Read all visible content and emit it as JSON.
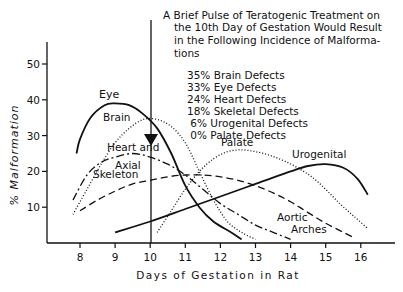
{
  "chart_data": {
    "type": "line",
    "title": "",
    "xlabel": "Days of Gestation in Rat",
    "ylabel": "% Malformation",
    "xlim": [
      7.1,
      17.2
    ],
    "ylim": [
      0,
      55
    ],
    "x_ticks": [
      8,
      9,
      10,
      11,
      12,
      13,
      14,
      15,
      16
    ],
    "y_ticks": [
      10,
      20,
      30,
      40,
      50
    ],
    "grid": false,
    "annotation": {
      "lines": [
        "A Brief Pulse of Teratogenic Treatment on",
        "the 10th Day of Gestation Would Result",
        "in the Following Incidence of Malforma-",
        "tions"
      ],
      "list": [
        "35% Brain Defects",
        "33% Eye Defects",
        "24% Heart Defects",
        "18% Skeletal Defects",
        " 6% Urogenital Defects",
        " 0% Palate Defects"
      ],
      "arrow_at_day": 10
    },
    "series": [
      {
        "name": "Eye",
        "style": "solid",
        "x": [
          7.9,
          8.0,
          8.3,
          8.7,
          9.0,
          9.4,
          9.8,
          10.2,
          10.6,
          11.0,
          11.4,
          11.8,
          12.3,
          12.6
        ],
        "y": [
          25,
          29,
          35,
          38.5,
          39,
          38.5,
          36,
          32,
          25,
          16,
          10,
          6,
          3,
          1
        ]
      },
      {
        "name": "Brain",
        "style": "dotted",
        "x": [
          7.8,
          8.2,
          8.6,
          9.0,
          9.4,
          9.8,
          10.2,
          10.6,
          11.0,
          11.4,
          11.8,
          12.2,
          12.6,
          13.0
        ],
        "y": [
          8,
          15,
          22,
          28,
          32,
          34.5,
          34.5,
          32.5,
          28,
          20,
          12,
          6,
          3,
          1
        ]
      },
      {
        "name": "Heart and Aortic Arches",
        "style": "dash-dot",
        "x": [
          7.8,
          8.2,
          8.6,
          9.0,
          9.5,
          10.0,
          10.5,
          11.0,
          11.5,
          12.0,
          12.5,
          13.0,
          13.5,
          14.0
        ],
        "y": [
          12,
          19,
          22.5,
          24,
          25,
          24,
          22,
          19,
          15,
          11,
          8,
          5,
          3,
          1
        ]
      },
      {
        "name": "Axial Skeleton",
        "style": "dashed",
        "x": [
          8.0,
          8.5,
          9.0,
          9.5,
          10.0,
          10.5,
          11.0,
          11.5,
          12.0,
          12.5,
          13.0,
          13.5,
          14.0,
          14.5,
          15.0,
          15.5,
          15.8
        ],
        "y": [
          9,
          12,
          14.5,
          16.5,
          17.5,
          18.5,
          19,
          19,
          18.5,
          17.5,
          16,
          14,
          11.5,
          8.5,
          5.5,
          3,
          1.5
        ]
      },
      {
        "name": "Palate",
        "style": "dotted",
        "x": [
          10.2,
          10.6,
          11.0,
          11.4,
          11.8,
          12.2,
          12.6,
          13.0,
          13.4,
          13.8,
          14.2,
          14.6,
          15.0,
          15.4,
          15.8,
          16.2
        ],
        "y": [
          3,
          9,
          15,
          20,
          23.5,
          25.5,
          26,
          25.5,
          24.5,
          23,
          21,
          18.5,
          15,
          11,
          7.5,
          4
        ]
      },
      {
        "name": "Urogenital",
        "style": "solid",
        "x": [
          9.0,
          10.0,
          11.0,
          12.0,
          13.0,
          14.0,
          14.5,
          15.0,
          15.5,
          15.9,
          16.2
        ],
        "y": [
          3,
          6,
          9.5,
          13,
          16.5,
          20,
          21.5,
          22,
          21,
          18,
          13.5
        ]
      }
    ]
  }
}
